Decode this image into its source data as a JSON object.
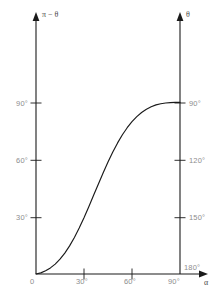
{
  "chart_data": {
    "type": "line",
    "title": "",
    "xlabel": "α",
    "ylabel_left": "π − θ",
    "ylabel_right": "θ",
    "xlim": [
      0,
      90
    ],
    "ylim_left": [
      0,
      100
    ],
    "ylim_right": [
      180,
      80
    ],
    "grid": false,
    "legend": null,
    "xticks": [
      {
        "value": 0,
        "label": "0"
      },
      {
        "value": 30,
        "label": "30°"
      },
      {
        "value": 60,
        "label": "60°"
      },
      {
        "value": 90,
        "label": "90°"
      }
    ],
    "yticks_left": [
      {
        "value": 30,
        "label": "30°"
      },
      {
        "value": 60,
        "label": "60°"
      },
      {
        "value": 90,
        "label": "90°"
      }
    ],
    "yticks_right": [
      {
        "value": 90,
        "label": "90°"
      },
      {
        "value": 120,
        "label": "120°"
      },
      {
        "value": 150,
        "label": "150°"
      },
      {
        "value": 180,
        "label": "180°"
      }
    ],
    "series": [
      {
        "name": "pi-minus-theta-vs-alpha",
        "color": "#1a1a1a",
        "x": [
          0,
          3,
          6,
          9,
          12,
          15,
          18,
          21,
          24,
          27,
          30,
          33,
          36,
          39,
          42,
          45,
          48,
          51,
          54,
          57,
          60,
          63,
          66,
          69,
          72,
          75,
          78,
          81,
          84,
          87,
          90
        ],
        "values": [
          0,
          0.6,
          1.7,
          3.2,
          5.2,
          7.8,
          11.0,
          14.8,
          19.2,
          24.2,
          29.6,
          35.4,
          41.4,
          47.4,
          53.3,
          58.9,
          64.2,
          69.0,
          73.3,
          77.0,
          80.2,
          82.8,
          85.0,
          86.7,
          88.0,
          89.0,
          89.6,
          90.0,
          90.2,
          90.3,
          90.3
        ]
      }
    ],
    "axis_color": "#1a1a1a",
    "tick_color": "#8d8d8d"
  }
}
